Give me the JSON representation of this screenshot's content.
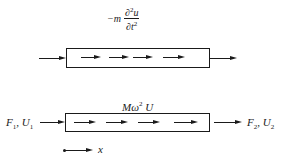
{
  "top_element": {
    "force_label": {
      "prefix": "−m",
      "numerator": "∂",
      "num_sup": "2",
      "num_var": "u",
      "denominator": "∂t",
      "den_sup": "2"
    },
    "inner_arrow_count": 4
  },
  "bottom_element": {
    "force_label": {
      "text": "Mω",
      "sup": "2",
      "suffix": " U"
    },
    "left_label": {
      "F": "F",
      "F_sub": "1",
      "sep": ", ",
      "U": "U",
      "U_sub": "1"
    },
    "right_label": {
      "F": "F",
      "F_sub": "2",
      "sep": ", ",
      "U": "U",
      "U_sub": "2"
    },
    "inner_arrow_count": 4
  },
  "axis": {
    "label": "x"
  },
  "colors": {
    "ink": "#1a1a1a",
    "background": "#ffffff"
  }
}
